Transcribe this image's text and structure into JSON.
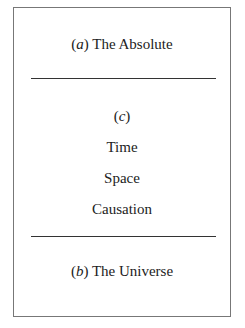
{
  "diagram": {
    "top": {
      "marker": "a",
      "label": "The Absolute"
    },
    "middle": {
      "marker": "c",
      "items": [
        "Time",
        "Space",
        "Causation"
      ]
    },
    "bottom": {
      "marker": "b",
      "label": "The Universe"
    }
  }
}
